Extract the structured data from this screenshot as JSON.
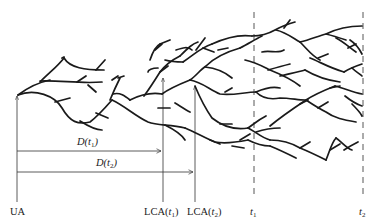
{
  "diagram": {
    "type": "genealogy-tree",
    "colors": {
      "branch": "#1a1a1a",
      "guide": "#333333",
      "background": "#ffffff"
    },
    "labels": {
      "ua": "UA",
      "lca_t1": {
        "prefix": "LCA(",
        "var": "t",
        "sub": "1",
        "suffix": ")"
      },
      "lca_t2": {
        "prefix": "LCA(",
        "var": "t",
        "sub": "2",
        "suffix": ")"
      },
      "t1": {
        "var": "t",
        "sub": "1"
      },
      "t2": {
        "var": "t",
        "sub": "2"
      },
      "d_t1": {
        "prefix": "D(",
        "var": "t",
        "sub": "1",
        "suffix": ")"
      },
      "d_t2": {
        "prefix": "D(",
        "var": "t",
        "sub": "2",
        "suffix": ")"
      }
    },
    "markers": [
      {
        "name": "UA",
        "x": 17,
        "kind": "vertical-arrow"
      },
      {
        "name": "LCA(t1)",
        "x": 163,
        "kind": "vertical-arrow"
      },
      {
        "name": "LCA(t2)",
        "x": 195,
        "kind": "vertical-arrow"
      },
      {
        "name": "t1",
        "x": 254,
        "kind": "dashed-line"
      },
      {
        "name": "t2",
        "x": 363,
        "kind": "dashed-line"
      }
    ],
    "distances": [
      {
        "name": "D(t1)",
        "from": "UA",
        "to": "LCA(t1)"
      },
      {
        "name": "D(t2)",
        "from": "UA",
        "to": "LCA(t2)"
      }
    ]
  }
}
